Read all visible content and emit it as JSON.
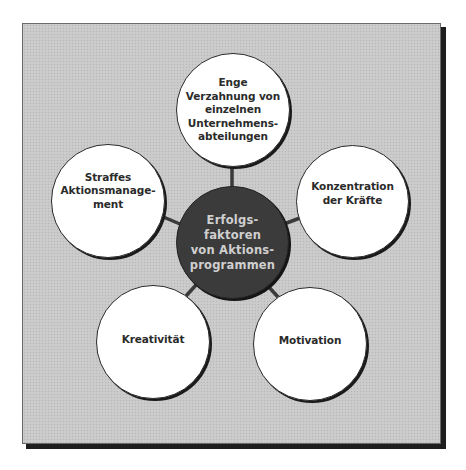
{
  "diagram": {
    "type": "hub-and-spoke",
    "colors": {
      "frame_background": "#c9c9c9",
      "frame_shadow": "#1e1e1e",
      "center_fill": "#3b3b3b",
      "center_text": "#cfcfcf",
      "outer_fill": "#ffffff",
      "outer_text": "#2b2b2b",
      "connector": "#3a3a3a"
    },
    "center": {
      "lines": [
        "Erfolgs-",
        "faktoren",
        "von Aktions-",
        "programmen"
      ]
    },
    "nodes": [
      {
        "id": "top",
        "lines": [
          "Enge",
          "Verzahnung von",
          "einzelnen",
          "Unternehmens-",
          "abteilungen"
        ]
      },
      {
        "id": "right",
        "lines": [
          "Konzentration",
          "der Kräfte"
        ]
      },
      {
        "id": "bottom-right",
        "lines": [
          "Motivation"
        ]
      },
      {
        "id": "bottom-left",
        "lines": [
          "Kreativität"
        ]
      },
      {
        "id": "left",
        "lines": [
          "Straffes",
          "Aktionsmanage-",
          "ment"
        ]
      }
    ]
  }
}
